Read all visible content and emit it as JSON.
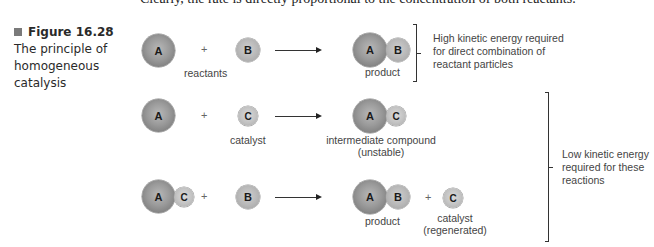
{
  "page": {
    "top_text_fragment": "Clearly, the rate is directly proportional to the concentration of both reactants."
  },
  "figure": {
    "number": "Figure 16.28",
    "caption_line1": "The principle of",
    "caption_line2": "homogeneous catalysis",
    "marker_color": "#7a7a7a"
  },
  "rows": [
    {
      "reactant1": "A",
      "plus": "+",
      "reactant2": "B",
      "reactants_label": "reactants",
      "product_atoms": [
        "A",
        "B"
      ],
      "product_label": "product"
    },
    {
      "reactant1": "A",
      "plus": "+",
      "reactant2": "C",
      "reactant2_label": "catalyst",
      "product_atoms": [
        "A",
        "C"
      ],
      "product_label_line1": "intermediate compound",
      "product_label_line2": "(unstable)"
    },
    {
      "reactant1_atoms": [
        "A",
        "C"
      ],
      "plus": "+",
      "reactant2": "B",
      "product_atoms": [
        "A",
        "B"
      ],
      "product_label": "product",
      "plus2": "+",
      "byproduct": "C",
      "byproduct_label_line1": "catalyst",
      "byproduct_label_line2": "(regenerated)"
    }
  ],
  "notes": {
    "high_energy": {
      "line1": "High kinetic energy required",
      "line2": "for direct combination of",
      "line3": "reactant particles"
    },
    "low_energy": {
      "line1": "Low kinetic energy",
      "line2": "required for these",
      "line3": "reactions"
    }
  }
}
